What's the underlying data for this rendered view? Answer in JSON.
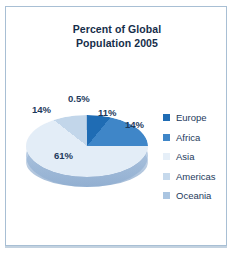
{
  "panel": {
    "border_color": "#a8bfd4",
    "background": "#ffffff"
  },
  "chart_data": {
    "type": "pie",
    "title": "Percent of Global Population 2005",
    "title_line_1": "Percent of Global",
    "title_line_2": "Population 2005",
    "categories": [
      "Europe",
      "Africa",
      "Asia",
      "Americas",
      "Oceania"
    ],
    "values": [
      11,
      14,
      61,
      14,
      0.5
    ],
    "value_labels": [
      "11%",
      "14%",
      "61%",
      "14%",
      "0.5%"
    ],
    "colors": [
      "#1f6cb4",
      "#3f86c8",
      "#e3edf7",
      "#c2d6ea",
      "#a9c4e0"
    ],
    "legend_position": "right",
    "xlabel": "",
    "ylabel": "",
    "grid": false,
    "three_d": true
  },
  "labels": {
    "europe_pct": "11%",
    "africa_pct": "14%",
    "asia_pct": "61%",
    "americas_pct": "14%",
    "oceania_pct": "0.5%"
  },
  "legend": {
    "items": [
      {
        "label": "Europe",
        "color": "#1f6cb4"
      },
      {
        "label": "Africa",
        "color": "#3f86c8"
      },
      {
        "label": "Asia",
        "color": "#e6eff8"
      },
      {
        "label": "Americas",
        "color": "#c6d9ec"
      },
      {
        "label": "Oceania",
        "color": "#aac5e1"
      }
    ]
  }
}
